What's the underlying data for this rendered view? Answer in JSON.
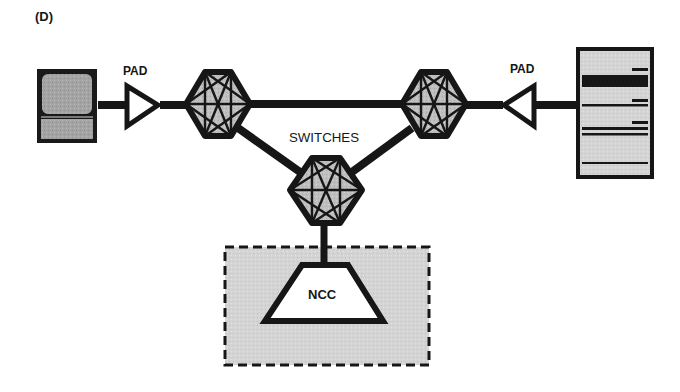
{
  "figure": {
    "panel_label": "(D)",
    "colors": {
      "ink": "#161616",
      "fill_gray": "#bdbdbd",
      "screen_gray": "#a9a9a9",
      "ncc_area": "#c8c8c8",
      "background": "#ffffff"
    }
  },
  "nodes": {
    "terminal": {
      "label": "",
      "type": "terminal-icon"
    },
    "pad_left": {
      "label": "PAD"
    },
    "pad_right": {
      "label": "PAD"
    },
    "switches": {
      "label": "SWITCHES",
      "count": 3
    },
    "host": {
      "label": "",
      "type": "host-computer-icon"
    },
    "ncc": {
      "label": "NCC"
    }
  },
  "edges": [
    [
      "terminal",
      "pad_left"
    ],
    [
      "pad_left",
      "switch_left"
    ],
    [
      "switch_left",
      "switch_right"
    ],
    [
      "switch_left",
      "switch_center"
    ],
    [
      "switch_right",
      "switch_center"
    ],
    [
      "switch_right",
      "pad_right"
    ],
    [
      "pad_right",
      "host"
    ],
    [
      "switch_center",
      "ncc"
    ]
  ]
}
